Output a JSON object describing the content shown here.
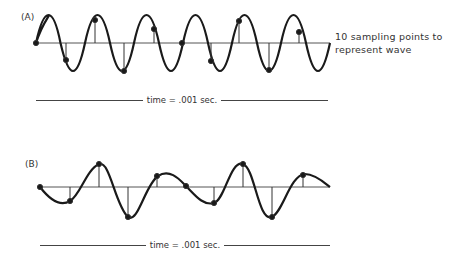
{
  "panel_a": {
    "label": "(A)",
    "note_line1": "10 sampling points to",
    "note_line2": "represent wave",
    "time_label": "time = .001 sec.",
    "sample_count": 10,
    "cycles": 6
  },
  "panel_b": {
    "label": "(B)",
    "time_label": "time = .001 sec."
  },
  "colors": {
    "stroke": "#1a1a1a",
    "axis": "#555555"
  }
}
